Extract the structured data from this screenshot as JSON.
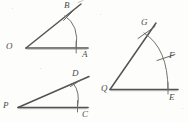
{
  "page": {
    "background_color": "#fdfdfc",
    "ink_color": "#4a4a4a",
    "line_color": "#555552",
    "width": 188,
    "height": 122
  },
  "figures": [
    {
      "id": "figure-oab",
      "name": "angle-O",
      "vertex_label": "O",
      "base_point_label": "A",
      "arc_point_label": "B",
      "vertex": [
        26,
        48
      ],
      "base_end": [
        88,
        48
      ],
      "ray_end": [
        80,
        5
      ],
      "arc_point": [
        69,
        13
      ],
      "arc_center": [
        26,
        48
      ],
      "arc_radius": 50,
      "arc_start_deg": -40,
      "arc_end_deg": 0,
      "tick_marks": [
        "B"
      ]
    },
    {
      "id": "figure-pcd",
      "name": "angle-P",
      "vertex_label": "P",
      "base_point_label": "C",
      "arc_point_label": "D",
      "vertex": [
        18,
        108
      ],
      "base_end": [
        88,
        108
      ],
      "ray_end": [
        88,
        77
      ],
      "arc_point": [
        75,
        81
      ],
      "arc_center": [
        18,
        108
      ],
      "arc_radius": 60,
      "arc_start_deg": -24,
      "arc_end_deg": 0,
      "tick_marks": [
        "D"
      ]
    },
    {
      "id": "figure-qgfe",
      "name": "angle-Q",
      "vertex_label": "Q",
      "base_point_label": "E",
      "arc_point_label": "G",
      "mid_point_label": "F",
      "vertex": [
        110,
        90
      ],
      "base_end": [
        178,
        90
      ],
      "ray_end": [
        155,
        24
      ],
      "arc_point": [
        146,
        35
      ],
      "mid_point": [
        169,
        60
      ],
      "arc_center": [
        110,
        90
      ],
      "arc_radius": 66,
      "arc_start_deg": -57,
      "arc_end_deg": 0,
      "tick_marks": [
        "G",
        "F"
      ]
    }
  ],
  "labels": [
    {
      "name": "label-O",
      "text": "O",
      "x": 6,
      "y": 43
    },
    {
      "name": "label-A",
      "text": "A",
      "x": 85,
      "y": 51
    },
    {
      "name": "label-B",
      "text": "B",
      "x": 66,
      "y": 2
    },
    {
      "name": "label-P",
      "text": "P",
      "x": 3,
      "y": 103
    },
    {
      "name": "label-C",
      "text": "C",
      "x": 84,
      "y": 110
    },
    {
      "name": "label-D",
      "text": "D",
      "x": 73,
      "y": 70
    },
    {
      "name": "label-Q",
      "text": "Q",
      "x": 101,
      "y": 85
    },
    {
      "name": "label-E",
      "text": "E",
      "x": 172,
      "y": 93
    },
    {
      "name": "label-G",
      "text": "G",
      "x": 142,
      "y": 19
    },
    {
      "name": "label-F",
      "text": "F",
      "x": 171,
      "y": 52
    }
  ]
}
